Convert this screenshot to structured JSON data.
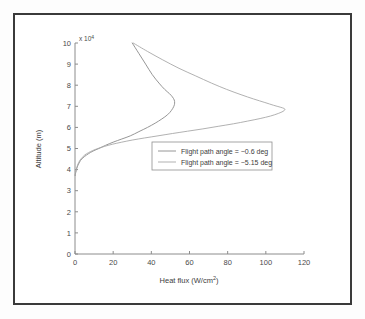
{
  "figure": {
    "background_color": "#ffffff",
    "border_color": "#3a3a3a"
  },
  "chart_data": {
    "type": "line",
    "title": "",
    "subtitle": "",
    "xlabel": "Heat flux (W/cm",
    "xlabel_superscript": "2",
    "xlabel_suffix": ")",
    "ylabel": "Altitude (m)",
    "y_exponent_label": "x 10",
    "y_exponent_power": "4",
    "xlim": [
      0,
      120
    ],
    "ylim": [
      0,
      10
    ],
    "xticks": [
      0,
      20,
      40,
      60,
      80,
      100,
      120
    ],
    "yticks": [
      0,
      1,
      2,
      3,
      4,
      5,
      6,
      7,
      8,
      9,
      10
    ],
    "xtick_labels": [
      "0",
      "20",
      "40",
      "60",
      "80",
      "100",
      "120"
    ],
    "ytick_labels": [
      "0",
      "1",
      "2",
      "3",
      "4",
      "5",
      "6",
      "7",
      "8",
      "9",
      "10"
    ],
    "grid": false,
    "legend_position": "center",
    "y_scale_multiplier": 10000,
    "series": [
      {
        "name": "Flight path angle = −0.6 deg",
        "color": "#8a8a8a",
        "points_upper": [
          [
            30.0,
            10.0
          ],
          [
            33.5,
            9.5
          ],
          [
            37.0,
            9.0
          ],
          [
            40.5,
            8.5
          ],
          [
            44.0,
            8.1
          ],
          [
            47.0,
            7.8
          ],
          [
            49.5,
            7.6
          ],
          [
            51.0,
            7.45
          ],
          [
            52.0,
            7.3
          ],
          [
            52.2,
            7.15
          ],
          [
            51.8,
            7.0
          ],
          [
            50.5,
            6.8
          ],
          [
            48.5,
            6.6
          ],
          [
            45.5,
            6.4
          ],
          [
            42.0,
            6.2
          ],
          [
            38.0,
            6.0
          ],
          [
            33.5,
            5.8
          ],
          [
            29.0,
            5.6
          ],
          [
            24.5,
            5.45
          ],
          [
            20.0,
            5.3
          ],
          [
            16.0,
            5.15
          ],
          [
            12.5,
            5.0
          ],
          [
            9.5,
            4.88
          ],
          [
            7.0,
            4.75
          ],
          [
            5.0,
            4.62
          ],
          [
            3.5,
            4.5
          ],
          [
            2.4,
            4.36
          ],
          [
            1.6,
            4.22
          ],
          [
            1.0,
            4.08
          ],
          [
            0.6,
            3.95
          ],
          [
            0.35,
            3.85
          ],
          [
            0.2,
            3.78
          ],
          [
            0.1,
            3.72
          ]
        ]
      },
      {
        "name": "Flight path angle = −5.15 deg",
        "color": "#a8a8a8",
        "points_upper": [
          [
            30.5,
            10.0
          ],
          [
            38.0,
            9.6
          ],
          [
            46.0,
            9.2
          ],
          [
            54.5,
            8.8
          ],
          [
            63.0,
            8.45
          ],
          [
            71.5,
            8.1
          ],
          [
            79.5,
            7.8
          ],
          [
            87.0,
            7.55
          ],
          [
            93.5,
            7.35
          ],
          [
            99.5,
            7.18
          ],
          [
            104.0,
            7.05
          ],
          [
            107.5,
            6.96
          ],
          [
            109.5,
            6.9
          ],
          [
            110.0,
            6.84
          ],
          [
            109.0,
            6.76
          ],
          [
            106.5,
            6.66
          ],
          [
            102.5,
            6.54
          ],
          [
            97.0,
            6.42
          ],
          [
            90.5,
            6.3
          ],
          [
            83.0,
            6.17
          ],
          [
            75.0,
            6.05
          ],
          [
            67.0,
            5.93
          ],
          [
            59.0,
            5.82
          ],
          [
            51.0,
            5.71
          ],
          [
            43.5,
            5.6
          ],
          [
            36.5,
            5.5
          ],
          [
            30.0,
            5.4
          ],
          [
            24.5,
            5.3
          ],
          [
            19.5,
            5.2
          ],
          [
            15.5,
            5.1
          ],
          [
            12.0,
            5.0
          ],
          [
            9.2,
            4.9
          ],
          [
            7.0,
            4.8
          ],
          [
            5.2,
            4.7
          ],
          [
            3.8,
            4.58
          ],
          [
            2.7,
            4.46
          ],
          [
            1.9,
            4.33
          ],
          [
            1.3,
            4.2
          ],
          [
            0.85,
            4.07
          ],
          [
            0.55,
            3.96
          ],
          [
            0.32,
            3.87
          ],
          [
            0.18,
            3.8
          ],
          [
            0.08,
            3.74
          ]
        ]
      }
    ]
  },
  "legend": {
    "entries": [
      {
        "label": "Flight path angle = −0.6 deg",
        "color": "#8a8a8a"
      },
      {
        "label": "Flight path angle = −5.15 deg",
        "color": "#a8a8a8"
      }
    ]
  }
}
